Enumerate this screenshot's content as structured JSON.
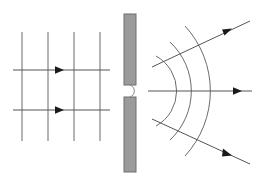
{
  "figure": {
    "canvas": {
      "width": 259,
      "height": 182,
      "background": "#ffffff"
    },
    "colors": {
      "line": "#6b6b6b",
      "ray": "#555555",
      "arrowhead": "#1a1a1a",
      "barrier_fill": "#9b9b9b",
      "barrier_stroke": "#6e6e6e",
      "slit_edge": "#8a8a8a",
      "background": "#ffffff"
    },
    "stroke_widths": {
      "wavefront": 1,
      "ray": 1,
      "barrier": 1
    }
  },
  "incident_region": {
    "label": "incident plane waves",
    "wavefronts": {
      "kind": "straight-vertical",
      "count": 4,
      "x_positions": [
        22,
        48,
        74,
        100
      ],
      "y_top": 32,
      "y_bottom": 141
    },
    "rays": [
      {
        "name": "upper-incident-ray",
        "x1": 13,
        "y1": 70,
        "x2": 110,
        "y2": 70,
        "arrow_at": {
          "x": 62,
          "y": 70
        },
        "direction": "right"
      },
      {
        "name": "lower-incident-ray",
        "x1": 13,
        "y1": 110,
        "x2": 110,
        "y2": 110,
        "arrow_at": {
          "x": 62,
          "y": 110
        },
        "direction": "right"
      }
    ]
  },
  "barrier": {
    "label": "opaque barrier with single slit",
    "x": 124,
    "width": 12,
    "upper_segment": {
      "y_top": 14,
      "y_bottom": 85
    },
    "lower_segment": {
      "y_top": 97,
      "y_bottom": 172
    },
    "slit": {
      "label": "slit aperture",
      "center_x": 130,
      "center_y": 91,
      "gap_top": 85,
      "gap_bottom": 97,
      "bulge_radius": 7
    }
  },
  "diffracted_region": {
    "label": "diffracted circular waves",
    "wavefronts": {
      "kind": "circular-arcs",
      "count": 3,
      "center": {
        "x": 136,
        "y": 91
      },
      "radii": [
        40,
        67,
        96
      ],
      "angle_span_deg": 118
    },
    "rays": [
      {
        "name": "upper-diffracted-ray",
        "x1": 152,
        "y1": 67,
        "x2": 247,
        "y2": 23,
        "arrow_at": {
          "x": 229,
          "y": 31
        },
        "direction": "up-right",
        "angle_deg": -25
      },
      {
        "name": "central-diffracted-ray",
        "x1": 148,
        "y1": 91,
        "x2": 252,
        "y2": 91,
        "arrow_at": {
          "x": 240,
          "y": 91
        },
        "direction": "right",
        "angle_deg": 0
      },
      {
        "name": "lower-diffracted-ray",
        "x1": 152,
        "y1": 119,
        "x2": 247,
        "y2": 162,
        "arrow_at": {
          "x": 229,
          "y": 154
        },
        "direction": "down-right",
        "angle_deg": 25
      }
    ]
  }
}
